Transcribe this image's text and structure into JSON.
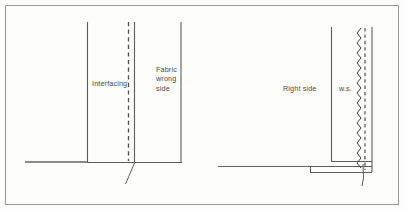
{
  "figure": {
    "kind": "sewing-construction-diagram",
    "background_color": "#fdfdfa",
    "line_color": "#555555",
    "border_color": "#9a9a96",
    "text_color": "#4a4a4a",
    "panels": [
      {
        "name": "left-panel",
        "description": "Interfacing applied to fabric wrong side, edge unfinished",
        "labels": [
          "Interfacing",
          "Fabric\nwrong\nside"
        ]
      },
      {
        "name": "right-panel",
        "description": "Right side of garment with zigzag finished seam allowance",
        "labels": [
          "Right side",
          "w.s."
        ]
      }
    ]
  },
  "labels": {
    "interfacing": "Interfacing",
    "fabric_wrong_side": "Fabric\nwrong\nside",
    "right_side": "Right side",
    "ws": "w.s."
  }
}
